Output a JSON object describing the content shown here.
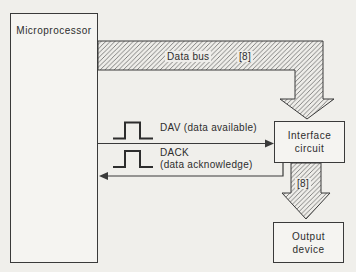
{
  "diagram": {
    "colors": {
      "paper": "#f0efeb",
      "ink": "#3a3a3a",
      "hatch_line": "#767676",
      "box_fill": "#f5f4f1"
    },
    "boxes": {
      "microprocessor": {
        "label": "Microprocessor"
      },
      "interface_circuit": {
        "line1": "Interface",
        "line2": "circuit"
      },
      "output_device": {
        "line1": "Output",
        "line2": "device"
      }
    },
    "data_bus": {
      "label": "Data bus",
      "width_label": "[8]"
    },
    "interface_to_output_bus": {
      "width_label": "[8]"
    },
    "signals": {
      "dav": {
        "label": "DAV (data available)"
      },
      "dack": {
        "line1": "DACK",
        "line2": "(data acknowledge)"
      }
    }
  }
}
